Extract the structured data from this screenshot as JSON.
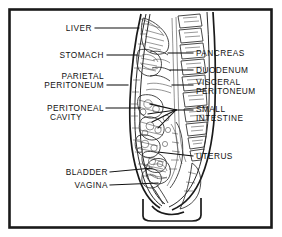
{
  "figure": {
    "frame_color": "#1a1a1a",
    "background_color": "#ffffff",
    "ink_color": "#111111",
    "labels_left": [
      {
        "id": "liver",
        "text": "LIVER",
        "lines": [
          "LIVER"
        ],
        "x": 92,
        "y": 31,
        "leader": [
          [
            95,
            28
          ],
          [
            139,
            28
          ]
        ]
      },
      {
        "id": "stomach",
        "text": "STOMACH",
        "lines": [
          "STOMACH"
        ],
        "x": 104,
        "y": 58,
        "leader": [
          [
            107,
            55
          ],
          [
            137,
            55
          ]
        ]
      },
      {
        "id": "parietal-peritoneum",
        "text": "PARIETAL PERITONEUM",
        "lines": [
          "PARIETAL",
          "PERITONEUM"
        ],
        "x": 104,
        "y": 76,
        "leader": [
          [
            107,
            85
          ],
          [
            128,
            85
          ]
        ]
      },
      {
        "id": "peritoneal-cavity",
        "text": "PERITONEAL CAVITY",
        "lines": [
          "PERITONEAL",
          "CAVITY"
        ],
        "x": 104,
        "y": 110,
        "leader": [
          [
            106,
            108
          ],
          [
            140,
            108
          ]
        ]
      },
      {
        "id": "bladder",
        "text": "BLADDER",
        "lines": [
          "BLADDER"
        ],
        "x": 108,
        "y": 175,
        "leader": [
          [
            110,
            172
          ],
          [
            152,
            168
          ]
        ]
      },
      {
        "id": "vagina",
        "text": "VAGINA",
        "lines": [
          "VAGINA"
        ],
        "x": 108,
        "y": 188,
        "leader": [
          [
            110,
            185
          ],
          [
            158,
            183
          ]
        ]
      }
    ],
    "labels_right": [
      {
        "id": "pancreas",
        "text": "PANCREAS",
        "lines": [
          "PANCREAS"
        ],
        "x": 196,
        "y": 56,
        "leader": [
          [
            193,
            53
          ],
          [
            168,
            53
          ]
        ]
      },
      {
        "id": "duodenum",
        "text": "DUODENUM",
        "lines": [
          "DUODENUM"
        ],
        "x": 196,
        "y": 73,
        "leader": [
          [
            193,
            70
          ],
          [
            170,
            70
          ]
        ]
      },
      {
        "id": "visceral-peritoneum",
        "text": "VISCERAL PERITONEUM",
        "lines": [
          "VISCERAL",
          "PERITONEUM"
        ],
        "x": 196,
        "y": 85,
        "leader": [
          [
            193,
            85
          ],
          [
            172,
            85
          ]
        ]
      },
      {
        "id": "small-intestine",
        "text": "SMALL INTESTINE",
        "lines": [
          "SMALL",
          "INTESTINE"
        ],
        "x": 196,
        "y": 112,
        "leader": [
          [
            193,
            110
          ],
          [
            176,
            110
          ]
        ]
      },
      {
        "id": "uterus",
        "text": "UTERUS",
        "lines": [
          "UTERUS"
        ],
        "x": 196,
        "y": 159,
        "leader": [
          [
            193,
            156
          ],
          [
            158,
            152
          ]
        ]
      }
    ],
    "small_intestine_fan": [
      [
        [
          176,
          110
        ],
        [
          150,
          104
        ]
      ],
      [
        [
          176,
          110
        ],
        [
          148,
          114
        ]
      ],
      [
        [
          176,
          110
        ],
        [
          152,
          122
        ]
      ],
      [
        [
          176,
          110
        ],
        [
          158,
          128
        ]
      ]
    ]
  }
}
